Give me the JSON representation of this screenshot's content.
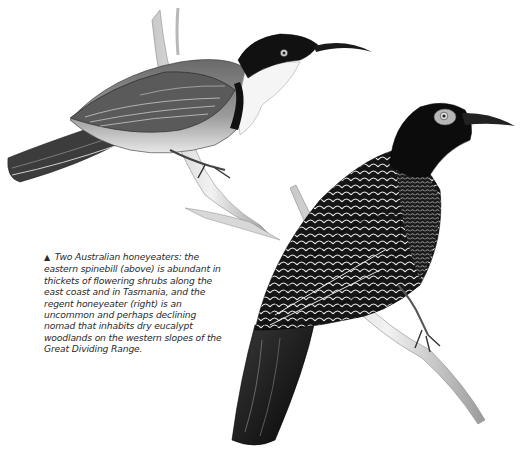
{
  "figure": {
    "illustrations": [
      {
        "id": "eastern-spinebill",
        "label": "eastern spinebill",
        "position": "above"
      },
      {
        "id": "regent-honeyeater",
        "label": "regent honeyeater",
        "position": "right"
      }
    ],
    "caption": {
      "marker": "▲",
      "text": "Two Australian honeyeaters: the eastern spinebill (above) is abundant in thickets of flowering shrubs along the east coast and in Tasmania, and the regent honeyeater (right) is an uncommon and perhaps declining nomad that inhabits dry eucalypt woodlands on the western slopes of the Great Dividing Range."
    },
    "colors": {
      "background": "#ffffff",
      "ink": "#1a1a1a",
      "caption_text": "#2a2a2a"
    }
  }
}
